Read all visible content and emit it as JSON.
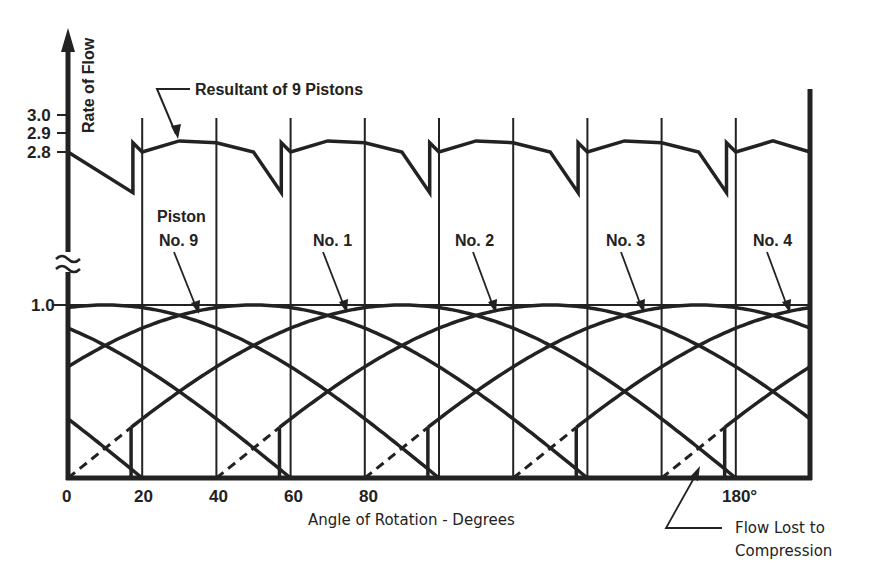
{
  "chart_data": {
    "type": "line",
    "title": "",
    "xlabel": "Angle of Rotation - Degrees",
    "ylabel": "Rate of Flow",
    "xlim": [
      0,
      200
    ],
    "x_ticks": [
      {
        "value": 0,
        "label": "0"
      },
      {
        "value": 20,
        "label": "20"
      },
      {
        "value": 40,
        "label": "40"
      },
      {
        "value": 60,
        "label": "60"
      },
      {
        "value": 80,
        "label": "80"
      },
      {
        "value": 180,
        "label": "180°"
      }
    ],
    "y_ticks_upper": [
      {
        "value": 3.0,
        "label": "3.0"
      },
      {
        "value": 2.9,
        "label": "2.9"
      },
      {
        "value": 2.8,
        "label": "2.8"
      }
    ],
    "y_ticks_lower": [
      {
        "value": 1.0,
        "label": "1.0"
      }
    ],
    "axis_break": true,
    "grid": {
      "vertical_every_deg": 20
    },
    "piston_count": 9,
    "piston_phase_spacing_deg": 40,
    "piston_flow_model": "half-sine over 180 deg, peak 1.0, with initial ~17 deg lost to compression (dashed)",
    "compression_loss_deg": 17,
    "series": [
      {
        "name": "Resultant of 9 Pistons",
        "period_deg": 40,
        "min": 2.62,
        "max": 2.87,
        "start": 2.8,
        "points": [
          [
            0,
            2.8
          ],
          [
            17.5,
            2.58
          ],
          [
            17.5,
            2.85
          ],
          [
            20,
            2.8
          ],
          [
            30,
            2.86
          ],
          [
            40,
            2.85
          ],
          [
            50,
            2.8
          ],
          [
            57.5,
            2.58
          ],
          [
            57.5,
            2.85
          ],
          [
            60,
            2.8
          ],
          [
            70,
            2.86
          ],
          [
            80,
            2.85
          ],
          [
            90,
            2.8
          ],
          [
            97.5,
            2.58
          ],
          [
            97.5,
            2.85
          ],
          [
            100,
            2.8
          ],
          [
            110,
            2.86
          ],
          [
            120,
            2.85
          ],
          [
            130,
            2.8
          ],
          [
            137.5,
            2.58
          ],
          [
            137.5,
            2.85
          ],
          [
            140,
            2.8
          ],
          [
            150,
            2.86
          ],
          [
            160,
            2.85
          ],
          [
            170,
            2.8
          ],
          [
            177.5,
            2.58
          ],
          [
            177.5,
            2.85
          ],
          [
            180,
            2.8
          ],
          [
            190,
            2.86
          ],
          [
            200,
            2.8
          ]
        ]
      },
      {
        "name": "Piston No. 9",
        "phase_deg": -40
      },
      {
        "name": "Piston No. 1",
        "phase_deg": 0
      },
      {
        "name": "Piston No. 2",
        "phase_deg": 40
      },
      {
        "name": "Piston No. 3",
        "phase_deg": 80
      },
      {
        "name": "Piston No. 4",
        "phase_deg": 120
      }
    ],
    "all_piston_phases_deg": [
      -160,
      -120,
      -80,
      -40,
      0,
      40,
      80,
      120,
      160
    ],
    "annotations": [
      {
        "text": "Resultant of 9 Pistons"
      },
      {
        "text_line1": "Piston",
        "text_line2": "No. 9"
      },
      {
        "text": "No. 1"
      },
      {
        "text": "No. 2"
      },
      {
        "text": "No. 3"
      },
      {
        "text": "No. 4"
      },
      {
        "text_line1": "Flow Lost to",
        "text_line2": "Compression"
      }
    ]
  },
  "labels": {
    "ylabel": "Rate of Flow",
    "xlabel": "Angle of Rotation - Degrees",
    "y30": "3.0",
    "y29": "2.9",
    "y28": "2.8",
    "y10": "1.0",
    "x0": "0",
    "x20": "20",
    "x40": "40",
    "x60": "60",
    "x80": "80",
    "x180": "180°",
    "resultant": "Resultant of 9 Pistons",
    "piston9_l1": "Piston",
    "piston9_l2": "No. 9",
    "no1": "No. 1",
    "no2": "No. 2",
    "no3": "No. 3",
    "no4": "No. 4",
    "flowlost_l1": "Flow Lost to",
    "flowlost_l2": "Compression"
  },
  "colors": {
    "ink": "#222222",
    "background": "#ffffff"
  }
}
